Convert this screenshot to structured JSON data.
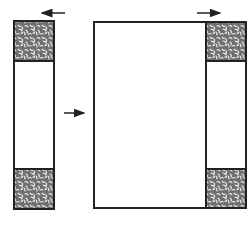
{
  "diagram": {
    "colors": {
      "stroke": "#222222",
      "background": "#ffffff",
      "texture_fill": "#6e6e6e",
      "texture_speckle": "#f2f2f2"
    },
    "left_state": {
      "column": {
        "x": 14,
        "y": 21,
        "w": 40,
        "h": 188
      },
      "top_block": {
        "x": 14,
        "y": 21,
        "w": 40,
        "h": 40
      },
      "bottom_block": {
        "x": 14,
        "y": 169,
        "w": 40,
        "h": 40
      },
      "arrow": {
        "direction": "left",
        "x1": 65,
        "x2": 41,
        "y": 13
      }
    },
    "transition_arrow": {
      "direction": "right",
      "x1": 64,
      "x2": 85,
      "y": 113
    },
    "right_state": {
      "large_rect": {
        "x": 94,
        "y": 22,
        "w": 112,
        "h": 186
      },
      "column": {
        "x": 206,
        "y": 22,
        "w": 40,
        "h": 186
      },
      "top_block": {
        "x": 206,
        "y": 22,
        "w": 40,
        "h": 39
      },
      "bottom_block": {
        "x": 206,
        "y": 169,
        "w": 40,
        "h": 39
      },
      "arrow": {
        "direction": "right",
        "x1": 197,
        "x2": 221,
        "y": 13
      }
    }
  }
}
